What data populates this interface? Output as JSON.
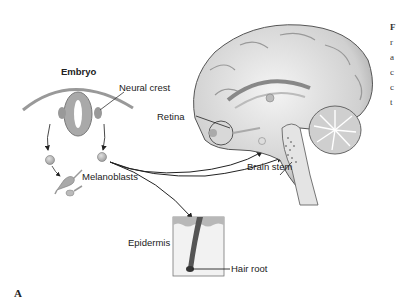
{
  "figure": {
    "panel_label": "A",
    "labels": {
      "embryo": "Embryo",
      "neural_crest": "Neural crest",
      "retina": "Retina",
      "melanoblasts": "Melanoblasts",
      "brain_stem": "Brain stem",
      "epidermis": "Epidermis",
      "hair_root": "Hair root"
    },
    "caption_fragments": [
      "F",
      "r",
      "a",
      "c",
      "c",
      "t"
    ]
  },
  "colors": {
    "background": "#ffffff",
    "line": "#333333",
    "tissue_gray": "#a8a8a8",
    "tissue_light": "#d6d6d6",
    "brain_light": "#e8e8e8",
    "brain_shadow": "#8a8a8a"
  }
}
